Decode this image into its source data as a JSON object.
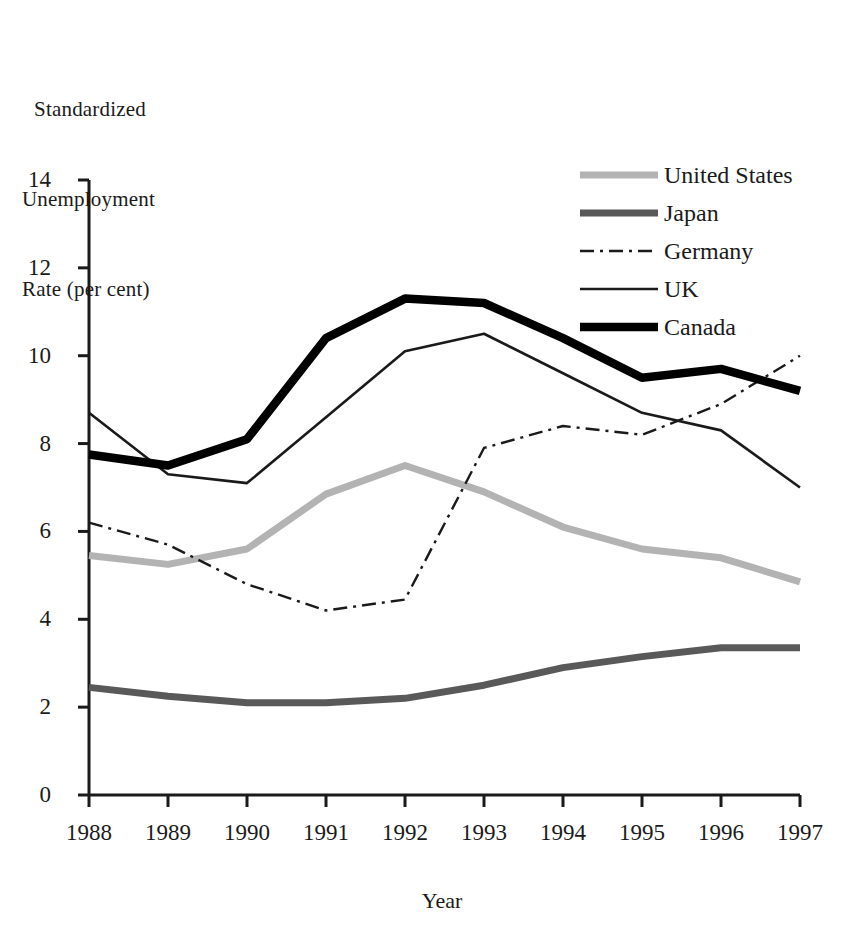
{
  "chart_data": {
    "type": "line",
    "title": "",
    "ylabel_lines": [
      "Standardized",
      "Unemployment",
      "Rate (per cent)"
    ],
    "ylabel": "Standardized Unemployment Rate (per cent)",
    "xlabel": "Year",
    "x": [
      1988,
      1989,
      1990,
      1991,
      1992,
      1993,
      1994,
      1995,
      1996,
      1997
    ],
    "categories": [
      "1988",
      "1989",
      "1990",
      "1991",
      "1992",
      "1993",
      "1994",
      "1995",
      "1996",
      "1997"
    ],
    "ylim": [
      0,
      14
    ],
    "yticks": [
      0,
      2,
      4,
      6,
      8,
      10,
      12,
      14
    ],
    "ytick_labels": [
      "0",
      "2",
      "4",
      "6",
      "8",
      "10",
      "12",
      "14"
    ],
    "grid": false,
    "legend_position": "top-right",
    "series": [
      {
        "name": "United States",
        "color": "#b3b3b3",
        "style": "solid-thick",
        "values": [
          5.45,
          5.25,
          5.6,
          6.85,
          7.5,
          6.9,
          6.1,
          5.6,
          5.4,
          4.85
        ]
      },
      {
        "name": "Japan",
        "color": "#595959",
        "style": "solid-thick",
        "values": [
          2.45,
          2.25,
          2.1,
          2.1,
          2.2,
          2.5,
          2.9,
          3.15,
          3.35,
          3.35
        ]
      },
      {
        "name": "Germany",
        "color": "#1a1a1a",
        "style": "dash-dot",
        "values": [
          6.2,
          5.7,
          4.8,
          4.2,
          4.45,
          7.9,
          8.4,
          8.2,
          8.9,
          10.0
        ]
      },
      {
        "name": "UK",
        "color": "#1a1a1a",
        "style": "solid-thin",
        "values": [
          8.7,
          7.3,
          7.1,
          8.6,
          10.1,
          10.5,
          9.6,
          8.7,
          8.3,
          7.0
        ]
      },
      {
        "name": "Canada",
        "color": "#000000",
        "style": "solid-extrathick",
        "values": [
          7.75,
          7.5,
          8.1,
          10.4,
          11.3,
          11.2,
          10.4,
          9.5,
          9.7,
          9.2
        ]
      }
    ]
  },
  "legend": {
    "items": [
      {
        "label": "United States"
      },
      {
        "label": "Japan"
      },
      {
        "label": "Germany"
      },
      {
        "label": "UK"
      },
      {
        "label": "Canada"
      }
    ]
  }
}
